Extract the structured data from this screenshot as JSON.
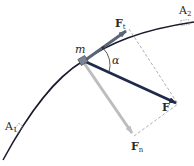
{
  "diagram": {
    "type": "force-decomposition",
    "labels": {
      "point_start": "A",
      "point_start_sub": "1",
      "point_end": "A",
      "point_end_sub": "2",
      "mass": "m",
      "angle": "α",
      "force": "F",
      "force_tangential": "F",
      "force_tangential_sub": "t",
      "force_normal": "F",
      "force_normal_sub": "n"
    },
    "colors": {
      "curve": "#1a1a2e",
      "force": "#1f2a4a",
      "force_tangential": "#5b6478",
      "force_normal": "#bdbdbd",
      "dashed": "#9a9a9a",
      "mass_block": "#7a8496"
    }
  }
}
